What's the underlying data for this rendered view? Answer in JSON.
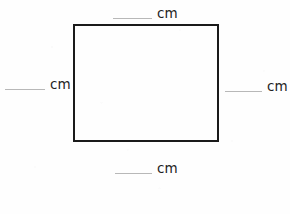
{
  "figure": {
    "type": "rectangle",
    "stroke_color": "#1a1a1a",
    "stroke_width_px": 2,
    "fill": "none",
    "left_px": 73,
    "top_px": 24,
    "width_px": 146,
    "height_px": 118
  },
  "page": {
    "background_color": "#fefefe",
    "blank_line_color": "#b8b8b8",
    "text_color": "#1f1f1f"
  },
  "measurements": {
    "top": {
      "position": "top",
      "answer_value": "",
      "unit": "cm"
    },
    "left": {
      "position": "left",
      "answer_value": "",
      "unit": "cm"
    },
    "right": {
      "position": "right",
      "answer_value": "",
      "unit": "cm"
    },
    "bottom": {
      "position": "bottom",
      "answer_value": "",
      "unit": "cm"
    }
  }
}
